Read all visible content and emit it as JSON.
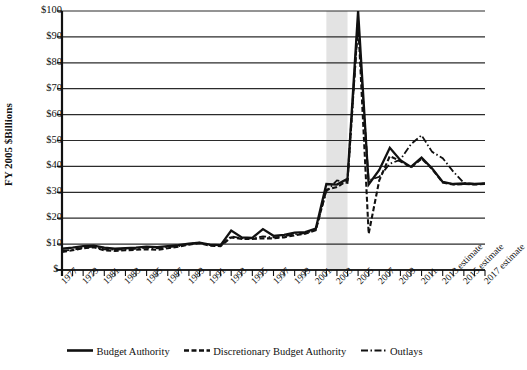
{
  "chart_data": {
    "type": "line",
    "title": "",
    "xlabel": "",
    "ylabel": "FY 2005 $Billions",
    "ylim": [
      0,
      100
    ],
    "ytick_labels": [
      "$100",
      "$90",
      "$80",
      "$70",
      "$60",
      "$50",
      "$40",
      "$30",
      "$20",
      "$10",
      "$-"
    ],
    "ytick_values": [
      100,
      90,
      80,
      70,
      60,
      50,
      40,
      30,
      20,
      10,
      0
    ],
    "grid": true,
    "legend_position": "bottom",
    "x": [
      1977,
      1978,
      1979,
      1980,
      1981,
      1982,
      1983,
      1984,
      1985,
      1986,
      1987,
      1988,
      1989,
      1990,
      1991,
      1992,
      1993,
      1994,
      1995,
      1996,
      1997,
      1998,
      1999,
      2000,
      2001,
      2002,
      2003,
      2004,
      2005,
      2006,
      2007,
      2008,
      2009,
      2010,
      2011,
      2012,
      2013,
      2014,
      2015,
      2016,
      2017
    ],
    "xtick_labels": [
      "1977",
      "1979",
      "1981",
      "1983",
      "1985",
      "1987",
      "1989",
      "1991",
      "1993",
      "1995",
      "1997",
      "1999",
      "2001",
      "2003",
      "2005",
      "2007",
      "2009",
      "2011",
      "2013 estimate",
      "2015 estimate",
      "2017 estimate"
    ],
    "xtick_values": [
      1977,
      1979,
      1981,
      1983,
      1985,
      1987,
      1989,
      1991,
      1993,
      1995,
      1997,
      1999,
      2001,
      2003,
      2005,
      2007,
      2009,
      2011,
      2013,
      2015,
      2017
    ],
    "highlight_band": {
      "start": 2002,
      "end": 2004,
      "color": "#e3e3e3"
    },
    "series": [
      {
        "name": "Budget Authority",
        "style": "solid",
        "color": "#111111",
        "values": [
          8.2,
          8.6,
          9.2,
          9.4,
          8.6,
          8.2,
          8.4,
          8.6,
          9.0,
          8.8,
          9.2,
          9.6,
          10.2,
          10.6,
          9.8,
          9.6,
          15.2,
          12.6,
          12.4,
          15.8,
          13.2,
          13.6,
          14.4,
          14.6,
          16.0,
          33.2,
          33.0,
          35.2,
          100.0,
          33.0,
          38.6,
          47.2,
          42.4,
          39.8,
          43.4,
          39.2,
          34.0,
          33.2,
          33.4,
          33.2,
          33.4
        ]
      },
      {
        "name": "Discretionary Budget Authority",
        "style": "dashed",
        "color": "#111111",
        "values": [
          7.0,
          7.6,
          8.4,
          8.8,
          7.6,
          7.4,
          7.6,
          7.8,
          8.0,
          7.8,
          8.4,
          9.0,
          9.8,
          10.4,
          9.4,
          9.2,
          12.6,
          12.0,
          12.0,
          12.2,
          12.2,
          12.6,
          13.4,
          14.0,
          15.4,
          31.0,
          32.0,
          34.6,
          96.0,
          14.0,
          34.6,
          44.0,
          42.0,
          39.6,
          43.0,
          39.0,
          33.8,
          33.0,
          33.2,
          33.0,
          33.2
        ]
      },
      {
        "name": "Outlays",
        "style": "dashdot",
        "color": "#111111",
        "values": [
          7.4,
          7.8,
          8.6,
          9.0,
          8.0,
          7.8,
          8.0,
          8.2,
          8.6,
          8.4,
          8.8,
          9.2,
          10.0,
          10.6,
          9.6,
          9.4,
          13.0,
          12.2,
          12.2,
          13.0,
          12.6,
          13.0,
          13.8,
          14.2,
          15.6,
          30.4,
          34.6,
          33.6,
          95.0,
          34.6,
          36.0,
          41.0,
          42.6,
          48.6,
          52.0,
          45.6,
          43.2,
          38.0,
          33.6,
          33.2,
          33.4
        ]
      }
    ]
  },
  "legend": {
    "items": [
      {
        "label": "Budget Authority",
        "style": "solid"
      },
      {
        "label": "Discretionary Budget Authority",
        "style": "dashed"
      },
      {
        "label": "Outlays",
        "style": "dashdot"
      }
    ]
  }
}
